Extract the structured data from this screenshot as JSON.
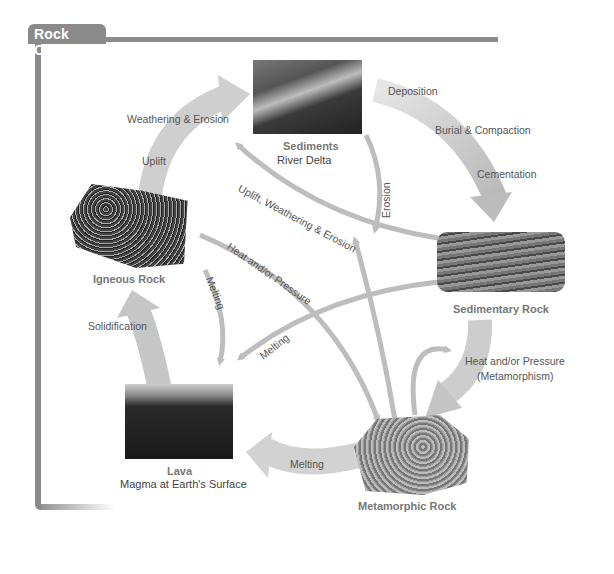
{
  "title": "Rock Cycle",
  "nodes": {
    "sediments": {
      "title": "Sediments",
      "subtitle": "River Delta"
    },
    "igneous": {
      "title": "Igneous Rock"
    },
    "sedimentary": {
      "title": "Sedimentary Rock"
    },
    "lava": {
      "title": "Lava",
      "subtitle": "Magma at Earth's Surface"
    },
    "metamorphic": {
      "title": "Metamorphic Rock"
    }
  },
  "processes": {
    "weathering_erosion": "Weathering & Erosion",
    "uplift": "Uplift",
    "deposition": "Deposition",
    "burial_compaction": "Burial & Compaction",
    "cementation": "Cementation",
    "uplift_weathering_erosion": "Uplift, Weathering & Erosion",
    "erosion": "Erosion",
    "heat_pressure": "Heat and/or Pressure",
    "melting_igneous": "Melting",
    "melting_sedimentary": "Melting",
    "solidification": "Solidification",
    "heat_pressure_metamorphism_1": "Heat and/or Pressure",
    "heat_pressure_metamorphism_2": "(Metamorphism)",
    "melting_metamorphic": "Melting"
  },
  "colors": {
    "frame": "#8a8a8a",
    "arrow_wide": "#c8c8c8",
    "arrow_thin": "#bdbdbd"
  }
}
